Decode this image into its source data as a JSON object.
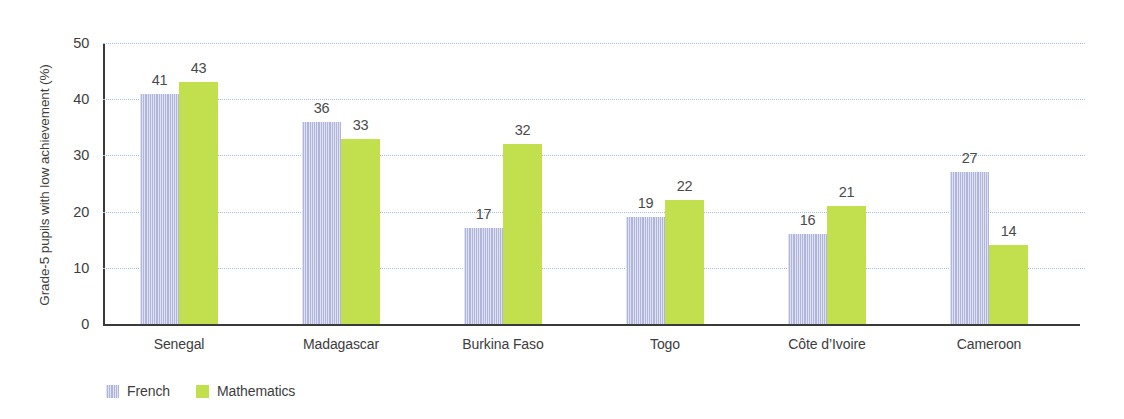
{
  "chart_data": {
    "type": "bar",
    "title": "",
    "xlabel": "",
    "ylabel": "Grade-5 pupils with low achievement (%)",
    "ylim": [
      0,
      50
    ],
    "yticks": [
      0,
      10,
      20,
      30,
      40,
      50
    ],
    "grid": true,
    "legend_position": "bottom-left",
    "categories": [
      "Senegal",
      "Madagascar",
      "Burkina Faso",
      "Togo",
      "Côte d’Ivoire",
      "Cameroon"
    ],
    "series": [
      {
        "name": "French",
        "color": "#b9bddf",
        "values": [
          41,
          36,
          17,
          19,
          16,
          27
        ]
      },
      {
        "name": "Mathematics",
        "color": "#c2e04e",
        "values": [
          43,
          33,
          32,
          22,
          21,
          14
        ]
      }
    ]
  },
  "axis": {
    "y_title": "Grade-5 pupils with low achievement (%)",
    "tick_labels": [
      "50",
      "40",
      "30",
      "20",
      "10",
      "0"
    ]
  },
  "legend": {
    "items": [
      {
        "label": "French",
        "swatch": "french-color-swatch"
      },
      {
        "label": "Mathematics",
        "swatch": "mathematics-color-swatch"
      }
    ]
  },
  "colors": {
    "french": "#b9bddf",
    "mathematics": "#c2e04e",
    "gridline": "#9fc4de",
    "axis": "#3a3a3a",
    "text": "#3d3d3d",
    "value_label": "#4a4a4a"
  }
}
